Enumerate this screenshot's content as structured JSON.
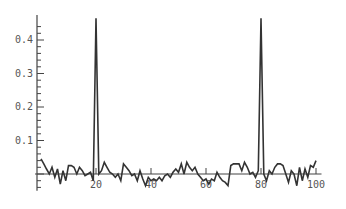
{
  "chart_data": {
    "type": "line",
    "title": "",
    "xlabel": "",
    "ylabel": "",
    "xlim": [
      0,
      100
    ],
    "ylim": [
      -0.05,
      0.47
    ],
    "grid": false,
    "legend": null,
    "x_ticks": [
      20,
      40,
      60,
      80,
      100
    ],
    "x_tick_labels": [
      "20",
      "40",
      "60",
      "80",
      "100"
    ],
    "y_ticks": [
      0.1,
      0.2,
      0.3,
      0.4
    ],
    "y_tick_labels": [
      "0.1",
      "0.2",
      "0.3",
      "0.4"
    ],
    "series": [
      {
        "name": "signal",
        "color": "#333333",
        "x": [
          0,
          1,
          2,
          3,
          4,
          5,
          6,
          7,
          8,
          9,
          10,
          11,
          12,
          13,
          14,
          15,
          16,
          17,
          18,
          19,
          20,
          21,
          22,
          23,
          24,
          25,
          26,
          27,
          28,
          29,
          30,
          31,
          32,
          33,
          34,
          35,
          36,
          37,
          38,
          39,
          40,
          41,
          42,
          43,
          44,
          45,
          46,
          47,
          48,
          49,
          50,
          51,
          52,
          53,
          54,
          55,
          56,
          57,
          58,
          59,
          60,
          61,
          62,
          63,
          64,
          65,
          66,
          67,
          68,
          69,
          70,
          71,
          72,
          73,
          74,
          75,
          76,
          77,
          78,
          79,
          80,
          81,
          82,
          83,
          84,
          85,
          86,
          87,
          88,
          89,
          90,
          91,
          92,
          93,
          94,
          95,
          96,
          97,
          98,
          99,
          100
        ],
        "values": [
          0.045,
          0.03,
          0.015,
          0.0,
          0.02,
          -0.01,
          0.015,
          -0.03,
          0.01,
          -0.02,
          0.025,
          0.025,
          0.02,
          0.0,
          0.02,
          0.01,
          -0.005,
          0.0,
          0.005,
          -0.02,
          0.465,
          0.0,
          0.01,
          0.035,
          0.02,
          0.005,
          0.0,
          -0.01,
          0.0,
          -0.02,
          0.03,
          0.02,
          0.01,
          -0.005,
          0.0,
          -0.02,
          0.01,
          -0.015,
          -0.035,
          -0.01,
          -0.02,
          -0.015,
          -0.02,
          -0.01,
          -0.02,
          -0.005,
          0.0,
          -0.01,
          0.005,
          0.015,
          0.005,
          0.03,
          0.0,
          0.035,
          0.02,
          0.01,
          0.02,
          0.0,
          -0.01,
          -0.02,
          -0.015,
          -0.03,
          -0.015,
          -0.02,
          0.005,
          -0.01,
          -0.02,
          -0.025,
          -0.035,
          0.025,
          0.03,
          0.03,
          0.03,
          0.01,
          0.035,
          0.02,
          0.0,
          0.005,
          -0.01,
          0.01,
          0.465,
          0.0,
          -0.02,
          0.01,
          0.0,
          0.02,
          0.03,
          0.03,
          0.025,
          0.0,
          -0.025,
          0.01,
          0.0,
          -0.035,
          0.02,
          -0.02,
          0.015,
          -0.01,
          0.025,
          0.02,
          0.04
        ]
      }
    ],
    "spikes": [
      {
        "x": 20,
        "y": 0.465
      },
      {
        "x": 80,
        "y": 0.465
      }
    ]
  }
}
